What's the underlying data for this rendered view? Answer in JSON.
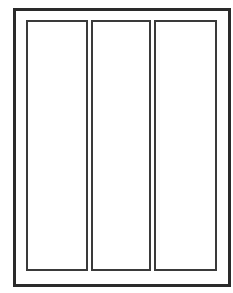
{
  "diagram": {
    "colors": {
      "background": "#ffffff",
      "outer_border": "#2a2a2a",
      "panel_border": "#3a3a3a"
    },
    "outer_frame": {
      "x": 13,
      "y": 8,
      "right": 231,
      "bottom": 285,
      "border_width": 3
    },
    "panels": [
      {
        "id": "panel-1",
        "x": 26,
        "y": 20,
        "right": 88,
        "bottom": 269
      },
      {
        "id": "panel-2",
        "x": 91,
        "y": 20,
        "right": 151,
        "bottom": 269
      },
      {
        "id": "panel-3",
        "x": 154,
        "y": 20,
        "right": 217,
        "bottom": 269
      }
    ]
  }
}
